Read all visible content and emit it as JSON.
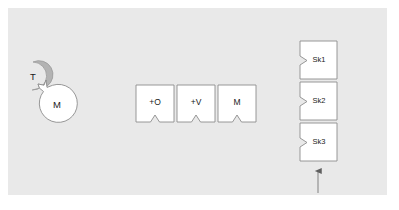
{
  "figure": {
    "background_color": "#ffffff",
    "panel_color": "#e9e9e9",
    "panel": {
      "x": 8,
      "y": 8,
      "width": 379,
      "height": 187
    }
  },
  "colors": {
    "panel": "#e9e9e9",
    "node_fill_white": "#ffffff",
    "node_fill_gray": "#b3b3b3",
    "node_stroke": "#8c8c8c",
    "text": "#1a1a1a",
    "arrow": "#6b6b6b"
  },
  "agents": {
    "group_name": "agent-pair",
    "tool": {
      "label": "T",
      "shape": "circle-with-tab",
      "fill": "#b3b3b3",
      "cx": 33,
      "cy": 76,
      "r": 14
    },
    "model": {
      "label": "M",
      "shape": "circle-with-socket",
      "fill": "#ffffff",
      "cx": 56,
      "cy": 104,
      "r": 19
    }
  },
  "operators": {
    "group_name": "operator-blocks",
    "items": [
      {
        "label": "+O",
        "x": 136,
        "y": 85,
        "width": 38,
        "height": 37
      },
      {
        "label": "+V",
        "x": 177,
        "y": 85,
        "width": 38,
        "height": 37
      },
      {
        "label": "M",
        "x": 218,
        "y": 85,
        "width": 38,
        "height": 37
      }
    ]
  },
  "skills": {
    "group_name": "skill-stack",
    "items": [
      {
        "label": "Sk1",
        "x": 300,
        "y": 41,
        "width": 37,
        "height": 38
      },
      {
        "label": "Sk2",
        "x": 300,
        "y": 82,
        "width": 37,
        "height": 38
      },
      {
        "label": "Sk3",
        "x": 300,
        "y": 123,
        "width": 37,
        "height": 38
      }
    ]
  },
  "annotation": {
    "arrow": {
      "name": "upward-arrow",
      "x": 318,
      "tip_y": 166,
      "tail_y": 193,
      "color": "#6b6b6b"
    }
  }
}
